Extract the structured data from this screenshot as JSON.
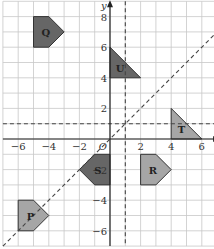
{
  "axes": {
    "x_label": "x",
    "y_label": "y",
    "origin_label": "O",
    "x_ticks": [
      "−6",
      "−4",
      "−2",
      "2",
      "4",
      "6"
    ],
    "y_ticks": [
      "8",
      "6",
      "4",
      "2",
      "−2",
      "−4",
      "−6"
    ]
  },
  "lines": [
    {
      "name": "x = 1",
      "style": "dashed"
    },
    {
      "name": "y = 1",
      "style": "dashed"
    },
    {
      "name": "y = x",
      "style": "dashed"
    }
  ],
  "shapes": [
    {
      "label": "Q",
      "color": "#666666",
      "points": [
        [
          -5,
          8
        ],
        [
          -4,
          8
        ],
        [
          -3,
          7
        ],
        [
          -4,
          6
        ],
        [
          -5,
          6
        ]
      ]
    },
    {
      "label": "U",
      "color": "#666666",
      "points": [
        [
          0,
          6
        ],
        [
          0,
          4
        ],
        [
          2,
          4
        ]
      ]
    },
    {
      "label": "T",
      "color": "#a6a6a6",
      "points": [
        [
          4,
          2
        ],
        [
          4,
          0
        ],
        [
          6,
          0
        ]
      ]
    },
    {
      "label": "S",
      "color": "#666666",
      "points": [
        [
          0,
          -1
        ],
        [
          -1,
          -1
        ],
        [
          -2,
          -2
        ],
        [
          -1,
          -3
        ],
        [
          0,
          -3
        ]
      ]
    },
    {
      "label": "R",
      "color": "#a6a6a6",
      "points": [
        [
          2,
          -1
        ],
        [
          3,
          -1
        ],
        [
          4,
          -2
        ],
        [
          3,
          -3
        ],
        [
          2,
          -3
        ]
      ]
    },
    {
      "label": "P",
      "color": "#a6a6a6",
      "points": [
        [
          -6,
          -4
        ],
        [
          -5,
          -4
        ],
        [
          -4,
          -5
        ],
        [
          -5,
          -6
        ],
        [
          -6,
          -6
        ]
      ]
    }
  ]
}
